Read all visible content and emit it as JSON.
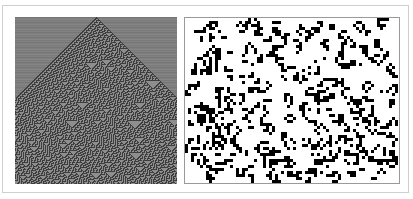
{
  "figure": {
    "panels": [
      {
        "id": "left",
        "description": "cellular automaton evolution from a single seed, triangular pattern",
        "colors": {
          "background": "#7a7a7a",
          "dark": "#3a3a3a",
          "light": "#9a9a9a"
        }
      },
      {
        "id": "right",
        "description": "two-dimensional cellular automaton snapshot, black cells on white",
        "colors": {
          "background": "#ffffff",
          "cell": "#000000"
        }
      }
    ],
    "frame_border": "#cfcfcf"
  }
}
